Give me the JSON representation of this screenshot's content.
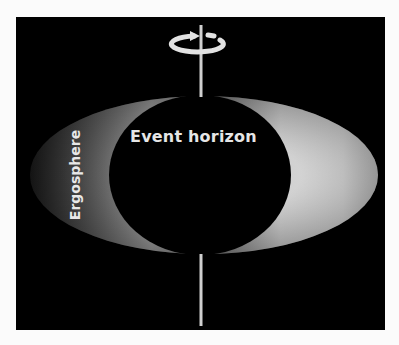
{
  "diagram": {
    "labels": {
      "event_horizon": "Event horizon",
      "ergosphere": "Ergosphere"
    },
    "elements": {
      "rotation_axis": "vertical spin axis",
      "rotation_arrow": "counter-clockwise rotation indicator"
    },
    "colors": {
      "background": "#000000",
      "frame": "#fbfbfb",
      "label": "#e6e6e6",
      "ergosphere_light": "#e0e0e0",
      "ergosphere_dark": "#3a3a3a"
    }
  }
}
